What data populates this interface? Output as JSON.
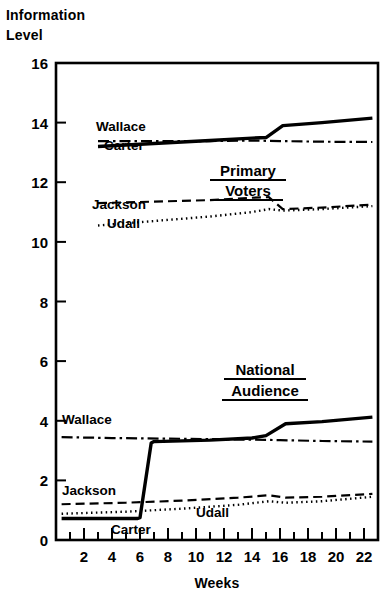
{
  "chart_data": {
    "type": "line",
    "title": "",
    "ylabel_line1": "Information",
    "ylabel_line2": "Level",
    "xlabel": "Weeks",
    "xlim": [
      0,
      23
    ],
    "ylim": [
      0,
      16
    ],
    "grid": false,
    "legend": "inline-labels",
    "xticks_major": [
      2,
      4,
      6,
      8,
      10,
      12,
      14,
      16,
      18,
      20,
      22
    ],
    "xtick_labels": [
      "2",
      "4",
      "6",
      "8",
      "10",
      "12",
      "14",
      "16",
      "18",
      "20",
      "22"
    ],
    "xticks_minor": [
      1,
      3,
      5,
      7,
      9,
      11,
      13,
      15,
      17,
      19,
      21,
      23
    ],
    "yticks": [
      0,
      2,
      4,
      6,
      8,
      10,
      12,
      14,
      16
    ],
    "ytick_labels": [
      "0",
      "2",
      "4",
      "6",
      "8",
      "10",
      "12",
      "14",
      "16"
    ],
    "groups": [
      {
        "name": "Primary Voters",
        "label_line1": "Primary",
        "label_line2": "Voters",
        "underlined": true
      },
      {
        "name": "National Audience",
        "label_line1": "National",
        "label_line2": "Audience",
        "underlined": true
      }
    ],
    "series": [
      {
        "name": "Wallace",
        "group": "Primary Voters",
        "style": "dash-dot",
        "x": [
          3.0,
          7.0,
          11.0,
          14.0,
          16.0,
          19.0,
          22.6
        ],
        "values": [
          13.38,
          13.38,
          13.38,
          13.4,
          13.38,
          13.36,
          13.35
        ]
      },
      {
        "name": "Carter",
        "group": "Primary Voters",
        "style": "solid",
        "x": [
          3.0,
          7.0,
          11.0,
          14.0,
          15.0,
          16.2,
          19.0,
          22.6
        ],
        "values": [
          13.2,
          13.3,
          13.4,
          13.48,
          13.5,
          13.9,
          14.0,
          14.15
        ]
      },
      {
        "name": "Jackson",
        "group": "Primary Voters",
        "style": "dashed",
        "x": [
          3.0,
          7.0,
          11.0,
          14.0,
          15.2,
          16.2,
          19.0,
          22.6
        ],
        "values": [
          11.3,
          11.35,
          11.4,
          11.48,
          11.5,
          11.1,
          11.15,
          11.25
        ]
      },
      {
        "name": "Udall",
        "group": "Primary Voters",
        "style": "dotted",
        "x": [
          3.0,
          7.0,
          11.0,
          14.0,
          15.2,
          16.2,
          19.0,
          22.6
        ],
        "values": [
          10.55,
          10.7,
          10.85,
          11.0,
          11.1,
          11.05,
          11.1,
          11.2
        ]
      },
      {
        "name": "Wallace",
        "group": "National Audience",
        "style": "dash-dot",
        "x": [
          0.4,
          4.0,
          8.0,
          12.0,
          16.0,
          19.0,
          22.6
        ],
        "values": [
          3.45,
          3.42,
          3.4,
          3.38,
          3.35,
          3.32,
          3.3
        ]
      },
      {
        "name": "Carter",
        "group": "National Audience",
        "style": "solid",
        "x": [
          0.4,
          5.8,
          6.0,
          6.8,
          7.0,
          11.0,
          14.0,
          15.0,
          16.4,
          19.0,
          22.6
        ],
        "values": [
          0.72,
          0.72,
          0.75,
          3.25,
          3.3,
          3.35,
          3.42,
          3.5,
          3.9,
          3.97,
          4.12
        ]
      },
      {
        "name": "Jackson",
        "group": "National Audience",
        "style": "dashed",
        "x": [
          0.4,
          5.0,
          9.0,
          13.0,
          15.2,
          16.4,
          19.0,
          22.6
        ],
        "values": [
          1.2,
          1.25,
          1.32,
          1.42,
          1.5,
          1.42,
          1.45,
          1.55
        ]
      },
      {
        "name": "Udall",
        "group": "National Audience",
        "style": "dotted",
        "x": [
          0.4,
          5.0,
          9.0,
          13.0,
          15.2,
          16.4,
          19.0,
          22.6
        ],
        "values": [
          0.88,
          0.95,
          1.05,
          1.18,
          1.3,
          1.25,
          1.3,
          1.45
        ]
      }
    ],
    "annotations": [
      {
        "text": "Wallace",
        "x_px": 96,
        "y_px": 131,
        "group": "Primary Voters"
      },
      {
        "text": "Carter",
        "x_px": 104,
        "y_px": 149,
        "group": "Primary Voters"
      },
      {
        "text": "Jackson",
        "x_px": 93,
        "y_px": 208,
        "group": "Primary Voters"
      },
      {
        "text": "Udall",
        "x_px": 107,
        "y_px": 227,
        "group": "Primary Voters"
      },
      {
        "text": "Wallace",
        "x_px": 62,
        "y_px": 424,
        "group": "National Audience"
      },
      {
        "text": "Jackson",
        "x_px": 62,
        "y_px": 494,
        "group": "National Audience"
      },
      {
        "text": "Udall",
        "x_px": 196,
        "y_px": 516,
        "group": "National Audience"
      },
      {
        "text": "Carter",
        "x_px": 111,
        "y_px": 533,
        "group": "National Audience"
      }
    ]
  },
  "axes": {
    "ylabel_line1": "Information",
    "ylabel_line2": "Level",
    "xlabel": "Weeks",
    "ytick_labels": [
      "16",
      "14",
      "12",
      "10",
      "8",
      "6",
      "4",
      "2",
      "0"
    ],
    "xtick_labels": [
      "2",
      "4",
      "6",
      "8",
      "10",
      "12",
      "14",
      "16",
      "18",
      "20",
      "22"
    ]
  },
  "labels": {
    "primary_voters_line1": "Primary",
    "primary_voters_line2": "Voters",
    "national_audience_line1": "National",
    "national_audience_line2": "Audience",
    "wallace_primary": "Wallace",
    "carter_primary": "Carter",
    "jackson_primary": "Jackson",
    "udall_primary": "Udall",
    "wallace_national": "Wallace",
    "jackson_national": "Jackson",
    "udall_national": "Udall",
    "carter_national": "Carter"
  },
  "colors": {
    "ink": "#000000",
    "paper": "#ffffff"
  }
}
